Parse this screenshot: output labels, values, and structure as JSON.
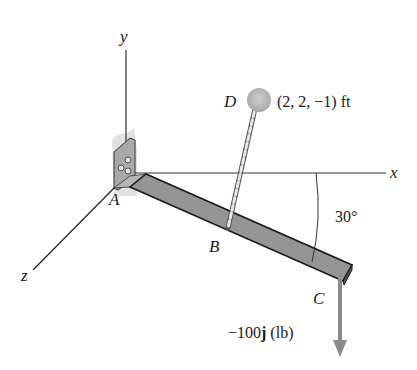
{
  "diagram": {
    "axes": {
      "x_label": "x",
      "y_label": "y",
      "z_label": "z"
    },
    "points": {
      "A": "A",
      "B": "B",
      "C": "C",
      "D": "D"
    },
    "d_coordinates": "(2, 2, −1) ft",
    "angle_label": "30°",
    "force": {
      "prefix": "−100",
      "unit_vector": "j",
      "unit": " (lb)"
    },
    "colors": {
      "beam": "#8c8c8c",
      "beam_edge": "#1a1a1a",
      "force_arrow": "#8a8a8a",
      "anchor": "#b5b5b5",
      "wall": "#d6d6d6"
    }
  }
}
